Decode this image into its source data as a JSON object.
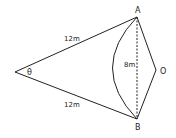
{
  "diagram": {
    "points": {
      "A": {
        "label": "A"
      },
      "B": {
        "label": "B"
      },
      "O": {
        "label": "O"
      }
    },
    "angle_label": "θ",
    "side_upper": "12m",
    "side_lower": "12m",
    "chord": "8m",
    "colors": {
      "stroke": "#222222",
      "background": "#ffffff"
    }
  }
}
